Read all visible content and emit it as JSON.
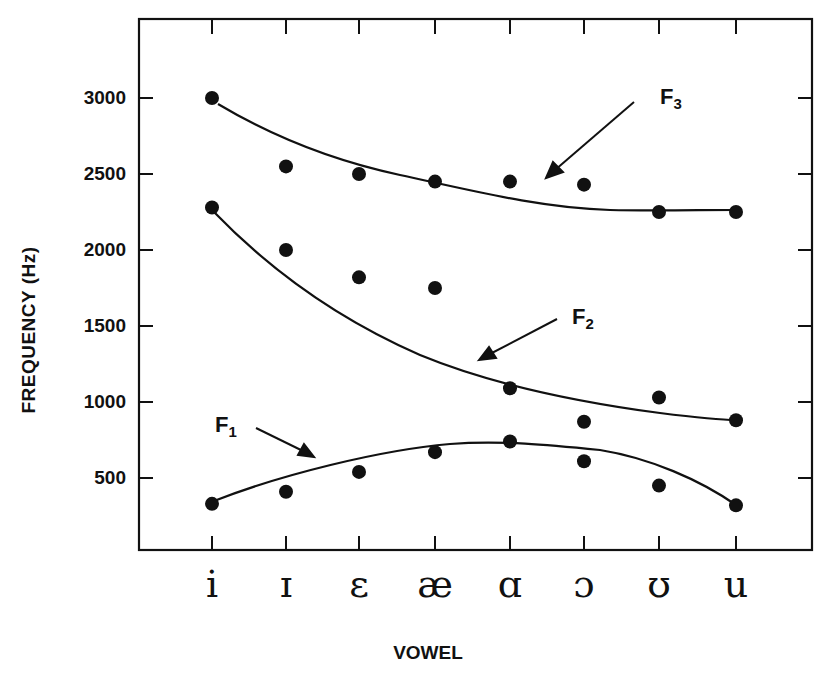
{
  "chart_data": {
    "type": "scatter",
    "title": "",
    "xlabel": "VOWEL",
    "ylabel": "FREQUENCY (Hz)",
    "categories": [
      "i",
      "ɪ",
      "ɛ",
      "æ",
      "ɑ",
      "ɔ",
      "ʊ",
      "u"
    ],
    "yticks": [
      500,
      1000,
      1500,
      2000,
      2500,
      3000
    ],
    "ylim": [
      0,
      3500
    ],
    "grid": false,
    "legend": "none (series labeled via arrow annotations)",
    "series": [
      {
        "name": "F1",
        "values": [
          330,
          410,
          540,
          670,
          740,
          610,
          450,
          320
        ],
        "fit_curve": true
      },
      {
        "name": "F2",
        "values": [
          2280,
          2000,
          1820,
          1750,
          1090,
          870,
          1030,
          880
        ],
        "fit_curve": true
      },
      {
        "name": "F3",
        "values": [
          3000,
          2550,
          2500,
          2450,
          2450,
          2430,
          2250,
          2250
        ],
        "fit_curve": true
      }
    ],
    "annotations": [
      {
        "text": "F1",
        "subscript": "1",
        "points_to": "F1 curve"
      },
      {
        "text": "F2",
        "subscript": "2",
        "points_to": "F2 curve"
      },
      {
        "text": "F3",
        "subscript": "3",
        "points_to": "F3 curve"
      }
    ]
  },
  "labels": {
    "ylabel": "FREQUENCY (Hz)",
    "xlabel": "VOWEL",
    "yticks": [
      "3000",
      "2500",
      "2000",
      "1500",
      "1000",
      "500"
    ],
    "xticks": [
      "i",
      "ɪ",
      "ɛ",
      "æ",
      "ɑ",
      "ɔ",
      "ʊ",
      "u"
    ],
    "f1_letter": "F",
    "f1_sub": "1",
    "f2_letter": "F",
    "f2_sub": "2",
    "f3_letter": "F",
    "f3_sub": "3"
  }
}
